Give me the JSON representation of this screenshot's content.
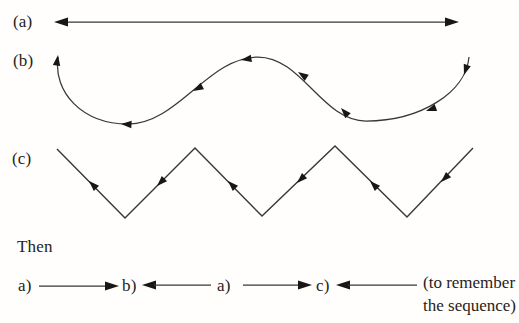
{
  "figure": {
    "rows": [
      {
        "label": "(a)",
        "shape": "straight-horizontal-line",
        "arrows": "double-headed-both-ends"
      },
      {
        "label": "(b)",
        "shape": "smooth-wave-curve",
        "arrows": "arrowheads-along-curve-pointing-left",
        "arrow_count": 8
      },
      {
        "label": "(c)",
        "shape": "zigzag-line",
        "arrows": "arrowheads-along-segments-pointing-left",
        "arrow_count": 6
      }
    ],
    "then_label": "Then",
    "sequence": {
      "items": [
        {
          "label": "a)",
          "arrow_after": "right-arrow"
        },
        {
          "label": "b)",
          "arrow_after": "left-arrow"
        },
        {
          "label": "a)",
          "arrow_after": "right-arrow"
        },
        {
          "label": "c)",
          "arrow_after": "left-arrow"
        }
      ],
      "note_line1": "(to remember",
      "note_line2": "the sequence)"
    },
    "colors": {
      "stroke": "#3a3733",
      "arrowhead": "#191715",
      "text": "#262321",
      "background": "#fffefd"
    }
  }
}
